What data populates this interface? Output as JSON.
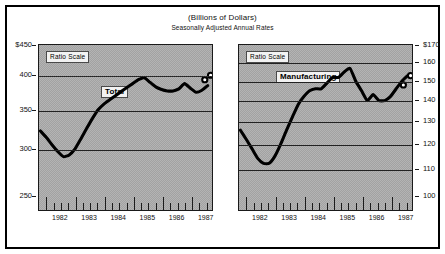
{
  "figure": {
    "title": "(Billions of Dollars)",
    "subtitle": "Seasonally Adjusted Annual Rates"
  },
  "chart_data": [
    {
      "type": "line",
      "title": "Total",
      "series_label": "Total",
      "scale_note": "Ratio Scale",
      "xlabel": "",
      "ylabel": "",
      "ylim": [
        250,
        450
      ],
      "ytick_labels": [
        "$450",
        "400",
        "350",
        "300",
        "250"
      ],
      "ytick_values": [
        450,
        400,
        350,
        300,
        250
      ],
      "gridlines": [
        400,
        350,
        300
      ],
      "grid": true,
      "xlim": [
        1981.75,
        1987.75
      ],
      "xtick_labels": [
        "1982",
        "1983",
        "1984",
        "1985",
        "1986",
        "1987"
      ],
      "xtick_values": [
        1982,
        1983,
        1984,
        1985,
        1986,
        1987
      ],
      "legend": "none",
      "marker_note": "open circles mark last two (preliminary) observations",
      "x": [
        1981.8,
        1982.0,
        1982.2,
        1982.4,
        1982.6,
        1982.8,
        1983.0,
        1983.2,
        1983.4,
        1983.6,
        1983.8,
        1984.0,
        1984.2,
        1984.4,
        1984.6,
        1984.8,
        1985.0,
        1985.2,
        1985.4,
        1985.6,
        1985.8,
        1986.0,
        1986.2,
        1986.4,
        1986.6,
        1986.8,
        1987.0,
        1987.2,
        1987.4,
        1987.6
      ],
      "values": [
        322,
        314,
        305,
        297,
        291,
        293,
        300,
        312,
        325,
        338,
        350,
        358,
        364,
        370,
        376,
        382,
        388,
        394,
        397,
        390,
        383,
        379,
        377,
        377,
        380,
        388,
        381,
        375,
        378,
        385
      ],
      "marker_points": [
        {
          "x": 1987.5,
          "y": 394
        },
        {
          "x": 1987.7,
          "y": 401
        }
      ]
    },
    {
      "type": "line",
      "title": "Manufacturing",
      "series_label": "Manufacturing",
      "scale_note": "Ratio Scale",
      "xlabel": "",
      "ylabel": "",
      "ylim": [
        100,
        170
      ],
      "ytick_labels": [
        "$170",
        "160",
        "150",
        "140",
        "130",
        "120",
        "110",
        "100"
      ],
      "ytick_values": [
        170,
        160,
        150,
        140,
        130,
        120,
        110,
        100
      ],
      "gridlines": [
        160,
        150,
        140,
        130,
        120,
        110
      ],
      "grid": true,
      "xlim": [
        1981.75,
        1987.75
      ],
      "xtick_labels": [
        "1982",
        "1983",
        "1984",
        "1985",
        "1986",
        "1987"
      ],
      "xtick_values": [
        1982,
        1983,
        1984,
        1985,
        1986,
        1987
      ],
      "legend": "none",
      "marker_note": "open circles mark last two (preliminary) observations",
      "x": [
        1981.8,
        1982.0,
        1982.2,
        1982.4,
        1982.6,
        1982.8,
        1983.0,
        1983.2,
        1983.4,
        1983.6,
        1983.8,
        1984.0,
        1984.2,
        1984.4,
        1984.6,
        1984.8,
        1985.0,
        1985.2,
        1985.4,
        1985.6,
        1985.8,
        1986.0,
        1986.2,
        1986.4,
        1986.6,
        1986.8,
        1987.0,
        1987.2,
        1987.4,
        1987.6
      ],
      "values": [
        126,
        122,
        118,
        114,
        112,
        112,
        115,
        120,
        126,
        132,
        138,
        142,
        145,
        146,
        146,
        149,
        152,
        152,
        155,
        157,
        150,
        145,
        140,
        143,
        140,
        140,
        142,
        146,
        150,
        153
      ],
      "marker_points": [
        {
          "x": 1987.45,
          "y": 148
        },
        {
          "x": 1987.7,
          "y": 153
        }
      ]
    }
  ]
}
